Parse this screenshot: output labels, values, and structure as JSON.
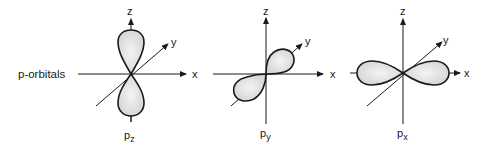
{
  "figure": {
    "side_label": "p-orbitals",
    "axis_labels": {
      "x": "x",
      "y": "y",
      "z": "z"
    },
    "colors": {
      "ink": "#1a1a1a",
      "lobe_fill": "#e4e4e4",
      "background": "#ffffff"
    },
    "orbitals": [
      {
        "id": "pz",
        "label_main": "p",
        "label_sub": "z",
        "lobe_axis": "z"
      },
      {
        "id": "py",
        "label_main": "p",
        "label_sub": "y",
        "lobe_axis": "y"
      },
      {
        "id": "px",
        "label_main": "p",
        "label_sub": "x",
        "lobe_axis": "x"
      }
    ]
  }
}
